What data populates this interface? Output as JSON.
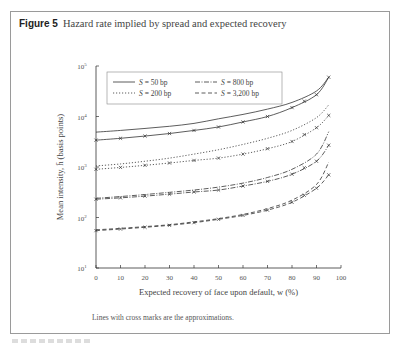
{
  "figure": {
    "label": "Figure 5",
    "title": "Hazard rate implied by spread and expected recovery",
    "note": "Lines with cross marks are the approximations."
  },
  "colors": {
    "frame": "#9a9a9a",
    "line": "#333333",
    "text": "#444444"
  },
  "chart_data": {
    "type": "line",
    "title": "Hazard rate implied by spread and expected recovery",
    "xlabel": "Expected recovery of face upon default, w (%)",
    "ylabel": "Mean intensity, h̄ (basis points)",
    "yscale": "log",
    "xlim": [
      0,
      100
    ],
    "ylim": [
      10,
      100000
    ],
    "xticks": [
      0,
      10,
      20,
      30,
      40,
      50,
      60,
      70,
      80,
      90,
      100
    ],
    "yticks": [
      "10^1",
      "10^2",
      "10^3",
      "10^4",
      "10^5"
    ],
    "grid": false,
    "legend_position": "top-left inside",
    "x": [
      0,
      10,
      20,
      30,
      40,
      50,
      60,
      70,
      80,
      90,
      95
    ],
    "series": [
      {
        "name": "S = 50 bp",
        "style": "solid",
        "marker": "none",
        "values": [
          4900,
          5300,
          5800,
          6400,
          7300,
          9000,
          11000,
          14000,
          19000,
          32000,
          60000
        ]
      },
      {
        "name": "S = 50 bp (approx.)",
        "style": "solid",
        "marker": "x",
        "values": [
          3400,
          3700,
          4100,
          4600,
          5300,
          6200,
          7800,
          10000,
          15000,
          27000,
          60000
        ]
      },
      {
        "name": "S = 200 bp",
        "style": "dotted",
        "marker": "none",
        "values": [
          1050,
          1150,
          1300,
          1500,
          1800,
          2200,
          2800,
          3700,
          5300,
          9500,
          17000
        ]
      },
      {
        "name": "S = 200 bp (approx.)",
        "style": "dotted",
        "marker": "x",
        "values": [
          900,
          980,
          1080,
          1200,
          1350,
          1500,
          1800,
          2300,
          3200,
          6000,
          10500
        ]
      },
      {
        "name": "S = 800 bp",
        "style": "dash-dot",
        "marker": "none",
        "values": [
          240,
          260,
          285,
          315,
          350,
          400,
          480,
          620,
          900,
          1800,
          5000
        ]
      },
      {
        "name": "S = 800 bp (approx.)",
        "style": "dash-dot",
        "marker": "x",
        "values": [
          230,
          245,
          265,
          290,
          320,
          350,
          420,
          520,
          720,
          1300,
          2700
        ]
      },
      {
        "name": "S = 3,200 bp",
        "style": "dashed",
        "marker": "none",
        "values": [
          57,
          61,
          66,
          72,
          82,
          95,
          115,
          150,
          220,
          450,
          1250
        ]
      },
      {
        "name": "S = 3,200 bp (approx.)",
        "style": "dashed",
        "marker": "x",
        "values": [
          55,
          59,
          64,
          70,
          79,
          92,
          110,
          140,
          200,
          380,
          700
        ]
      }
    ],
    "legend": [
      "S = 50 bp",
      "S = 200 bp",
      "S = 800 bp",
      "S = 3,200 bp"
    ]
  }
}
